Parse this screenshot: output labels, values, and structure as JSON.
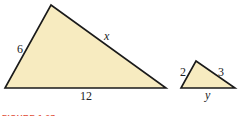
{
  "figure": {
    "caption": "FIGURE 1.27",
    "fill_color": "#f7ebc0",
    "stroke_color": "#1a1a1a",
    "caption_color": "#e2523c"
  },
  "large_triangle": {
    "side_left": "6",
    "side_right": "x",
    "side_bottom": "12"
  },
  "small_triangle": {
    "side_left": "2",
    "side_right": "3",
    "side_bottom": "y"
  }
}
